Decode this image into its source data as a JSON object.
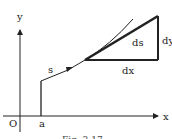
{
  "figure": {
    "labels": {
      "y_axis": "y",
      "x_axis": "x",
      "origin": "O",
      "a": "a",
      "s": "s",
      "ds": "ds",
      "dx": "dx",
      "dy": "dy"
    },
    "caption": "Fig. 3.17",
    "colors": {
      "line": "#222222",
      "background": "#ffffff"
    }
  }
}
